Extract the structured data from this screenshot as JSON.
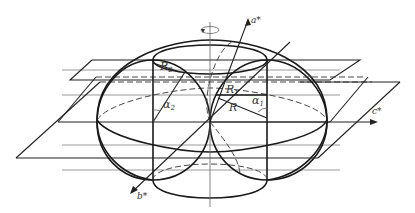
{
  "figure": {
    "labels": {
      "axis_a": "a*",
      "axis_b": "b*",
      "axis_c": "c*",
      "radius_R": "R",
      "radius_R1": "R",
      "radius_R1_sub": "1",
      "radius_R2": "R",
      "radius_R2_sub": "2",
      "angle_alpha1": "α",
      "angle_alpha1_sub": "1",
      "angle_alpha2": "α",
      "angle_alpha2_sub": "2"
    },
    "rotation_symbol": "rotation-arrow",
    "colors": {
      "line": "#1a1a1a",
      "grey_line": "#9a9a9a",
      "background": "#ffffff"
    }
  }
}
